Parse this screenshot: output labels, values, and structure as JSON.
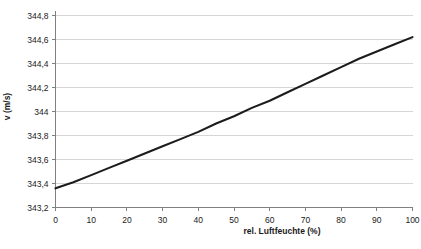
{
  "chart_data": {
    "type": "line",
    "title": "",
    "xlabel": "rel. Luftfeuchte (%)",
    "ylabel": "v (m/s)",
    "xlim": [
      0,
      100
    ],
    "ylim": [
      343.2,
      344.8
    ],
    "xticks": [
      "0",
      "10",
      "20",
      "30",
      "40",
      "50",
      "60",
      "70",
      "80",
      "90",
      "100"
    ],
    "xtick_values": [
      0,
      10,
      20,
      30,
      40,
      50,
      60,
      70,
      80,
      90,
      100
    ],
    "yticks": [
      "343,2",
      "343,4",
      "343,6",
      "343,8",
      "344",
      "344,2",
      "344,4",
      "344,6",
      "344,8"
    ],
    "ytick_values": [
      343.2,
      343.4,
      343.6,
      343.8,
      344.0,
      344.2,
      344.4,
      344.6,
      344.8
    ],
    "grid": "horizontal",
    "legend": "none",
    "decimal_separator": ",",
    "series": [
      {
        "name": "v (m/s)",
        "color": "#1c1c1c",
        "x": [
          0,
          5,
          10,
          15,
          20,
          25,
          30,
          35,
          40,
          45,
          50,
          55,
          60,
          65,
          70,
          75,
          80,
          85,
          90,
          95,
          100
        ],
        "values": [
          343.36,
          343.41,
          343.47,
          343.53,
          343.59,
          343.65,
          343.71,
          343.77,
          343.83,
          343.9,
          343.96,
          344.03,
          344.09,
          344.16,
          344.23,
          344.3,
          344.37,
          344.44,
          344.5,
          344.56,
          344.62
        ]
      }
    ]
  },
  "colors": {
    "grid": "#d6d6d6",
    "axis": "#808080",
    "line": "#1c1c1c",
    "text": "#1a1a1a",
    "background": "#ffffff"
  }
}
